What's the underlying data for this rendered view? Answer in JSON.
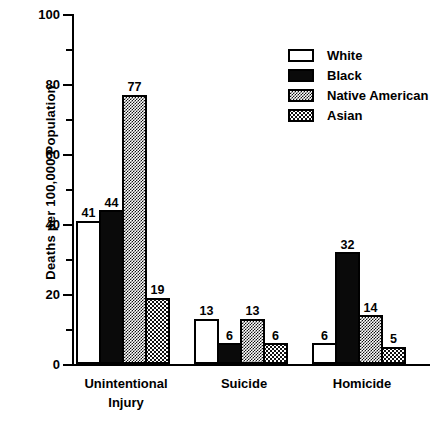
{
  "chart_data": {
    "type": "bar",
    "title": "",
    "xlabel": "",
    "ylabel": "Deaths per 100,000 Population",
    "ylim": [
      0,
      100
    ],
    "y_ticks_major": [
      0,
      20,
      40,
      60,
      80,
      100
    ],
    "y_ticks_minor": [
      10,
      30,
      50,
      70,
      90
    ],
    "y_tick_labels": [
      "0",
      "20",
      "40",
      "60",
      "80",
      "100"
    ],
    "grid": false,
    "legend_position": "top-right",
    "categories": [
      "Unintentional Injury",
      "Suicide",
      "Homicide"
    ],
    "category_lines": [
      [
        "Unintentional",
        "Injury"
      ],
      [
        "Suicide"
      ],
      [
        "Homicide"
      ]
    ],
    "series": [
      {
        "name": "White",
        "fill": "white",
        "values": [
          41,
          13,
          6
        ]
      },
      {
        "name": "Black",
        "fill": "black",
        "values": [
          44,
          6,
          32
        ]
      },
      {
        "name": "Native American",
        "fill": "dense-checker",
        "values": [
          77,
          13,
          14
        ]
      },
      {
        "name": "Asian",
        "fill": "light-stipple",
        "values": [
          19,
          6,
          5
        ]
      }
    ]
  },
  "axis": {
    "y_title": "Deaths per 100,000 Population",
    "tick_100": "100",
    "tick_80": "80",
    "tick_60": "60",
    "tick_40": "40",
    "tick_20": "20",
    "tick_0": "0"
  },
  "legend": {
    "items": [
      {
        "label": "White"
      },
      {
        "label": "Black"
      },
      {
        "label": "Native American"
      },
      {
        "label": "Asian"
      }
    ]
  },
  "groups": [
    {
      "label_line1": "Unintentional",
      "label_line2": "Injury",
      "bars": [
        {
          "series": "White",
          "value": 41,
          "value_label": "41"
        },
        {
          "series": "Black",
          "value": 44,
          "value_label": "44"
        },
        {
          "series": "Native American",
          "value": 77,
          "value_label": "77"
        },
        {
          "series": "Asian",
          "value": 19,
          "value_label": "19"
        }
      ]
    },
    {
      "label_line1": "Suicide",
      "label_line2": "",
      "bars": [
        {
          "series": "White",
          "value": 13,
          "value_label": "13"
        },
        {
          "series": "Black",
          "value": 6,
          "value_label": "6"
        },
        {
          "series": "Native American",
          "value": 13,
          "value_label": "13"
        },
        {
          "series": "Asian",
          "value": 6,
          "value_label": "6"
        }
      ]
    },
    {
      "label_line1": "Homicide",
      "label_line2": "",
      "bars": [
        {
          "series": "White",
          "value": 6,
          "value_label": "6"
        },
        {
          "series": "Black",
          "value": 32,
          "value_label": "32"
        },
        {
          "series": "Native American",
          "value": 14,
          "value_label": "14"
        },
        {
          "series": "Asian",
          "value": 5,
          "value_label": "5"
        }
      ]
    }
  ],
  "colors": {
    "ink": "#000000",
    "background": "#ffffff"
  }
}
